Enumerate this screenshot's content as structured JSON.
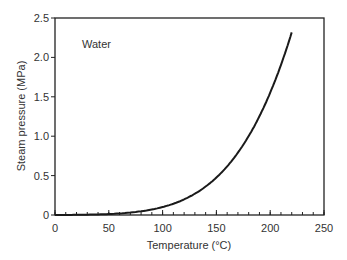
{
  "chart_data": {
    "type": "line",
    "title": "",
    "annotation": "Water",
    "xlabel": "Temperature (°C)",
    "ylabel": "Steam pressure (MPa)",
    "xlim": [
      0,
      250
    ],
    "ylim": [
      0,
      2.5
    ],
    "xticks": [
      0,
      50,
      100,
      150,
      200,
      250
    ],
    "yticks": [
      0,
      0.5,
      1.0,
      1.5,
      2.0,
      2.5
    ],
    "xtick_labels": [
      "0",
      "50",
      "100",
      "150",
      "200",
      "250"
    ],
    "ytick_labels": [
      "0",
      "0.5",
      "1.0",
      "1.5",
      "2.0",
      "2.5"
    ],
    "x_minor_step": 10,
    "grid": false,
    "legend": "none",
    "series": [
      {
        "name": "Water",
        "x": [
          0,
          20,
          40,
          60,
          80,
          100,
          110,
          120,
          130,
          140,
          150,
          160,
          170,
          180,
          190,
          200,
          210,
          220
        ],
        "values": [
          0.0006,
          0.0023,
          0.0074,
          0.0199,
          0.0474,
          0.1014,
          0.1434,
          0.1985,
          0.2703,
          0.3613,
          0.4758,
          0.6178,
          0.7917,
          1.0021,
          1.2544,
          1.5538,
          1.9062,
          2.3178
        ],
        "color": "#1a1a1a"
      }
    ]
  }
}
